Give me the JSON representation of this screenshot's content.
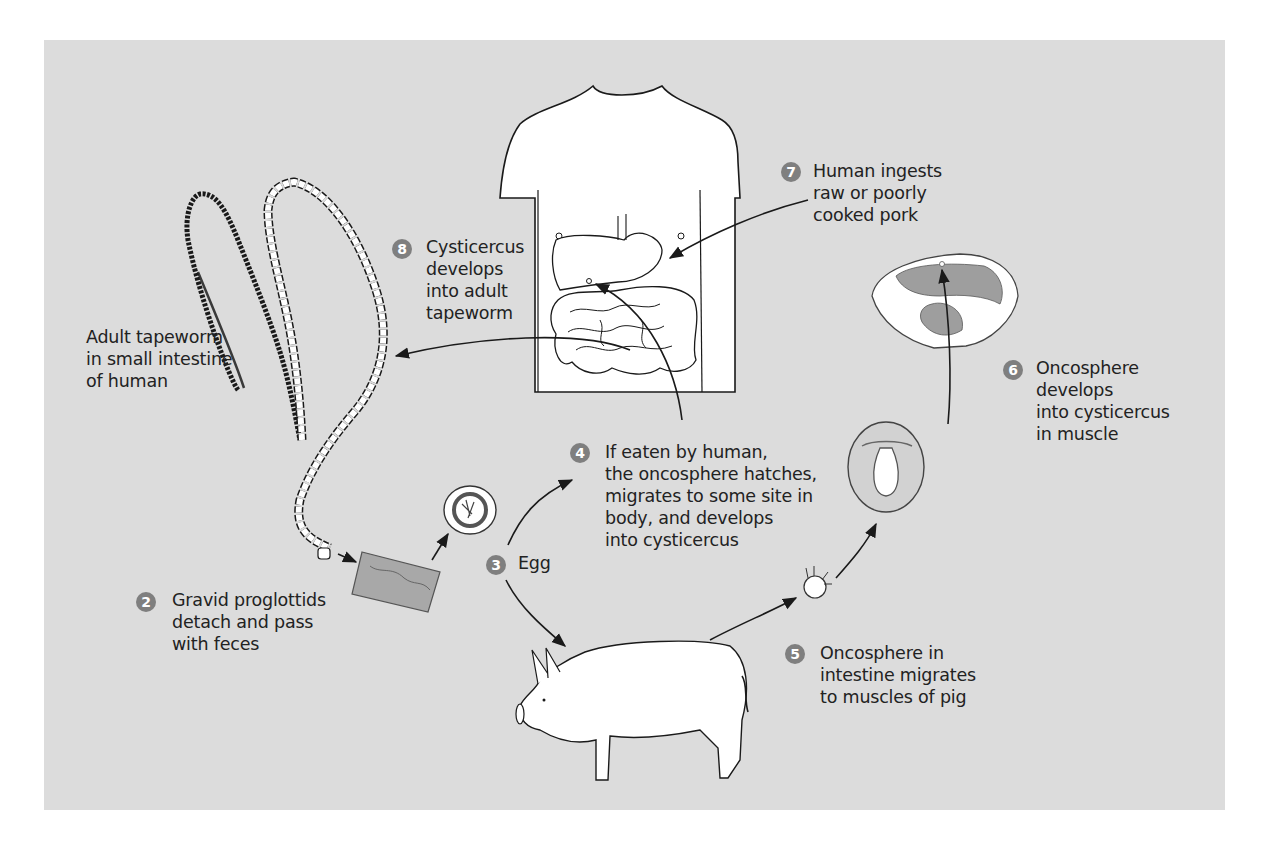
{
  "diagram": {
    "type": "life-cycle",
    "colors": {
      "panel_background": "#dcdcdc",
      "badge": "#7f7f7f",
      "text": "#222222",
      "illustration_fill": "#ffffff",
      "meat_muscle": "#9e9e9e"
    },
    "stages": [
      {
        "id": "adult",
        "number": "",
        "lines": [
          "Adult tapeworm",
          "in small intestine",
          "of human"
        ],
        "icon": "tapeworm-icon"
      },
      {
        "id": "2",
        "number": "2",
        "lines": [
          "Gravid proglottids",
          "detach and pass",
          "with feces"
        ],
        "icon": "proglottid-icon"
      },
      {
        "id": "3",
        "number": "3",
        "lines": [
          "Egg"
        ],
        "icon": "egg-icon"
      },
      {
        "id": "4",
        "number": "4",
        "lines": [
          "If eaten by human,",
          "the oncosphere hatches,",
          "migrates to some site in",
          "body, and develops",
          "into cysticercus"
        ],
        "icon": "human-torso-icon"
      },
      {
        "id": "5",
        "number": "5",
        "lines": [
          "Oncosphere in",
          "intestine migrates",
          "to muscles of pig"
        ],
        "icon": "pig-icon"
      },
      {
        "id": "6",
        "number": "6",
        "lines": [
          "Oncosphere",
          "develops",
          "into cysticercus",
          "in muscle"
        ],
        "icon": "cysticercus-icon"
      },
      {
        "id": "7",
        "number": "7",
        "lines": [
          "Human ingests",
          "raw or poorly",
          "cooked pork"
        ],
        "icon": "pork-meat-icon"
      },
      {
        "id": "8",
        "number": "8",
        "lines": [
          "Cysticercus",
          "develops",
          "into adult",
          "tapeworm"
        ],
        "icon": "intestine-icon"
      }
    ],
    "arrows": [
      {
        "from": "adult",
        "to": "2"
      },
      {
        "from": "2",
        "to": "3"
      },
      {
        "from": "3",
        "to": "4"
      },
      {
        "from": "3",
        "to": "5"
      },
      {
        "from": "5",
        "to": "6"
      },
      {
        "from": "6",
        "to": "7"
      },
      {
        "from": "7",
        "to": "8"
      },
      {
        "from": "4",
        "to": "8"
      },
      {
        "from": "8",
        "to": "adult"
      }
    ]
  }
}
